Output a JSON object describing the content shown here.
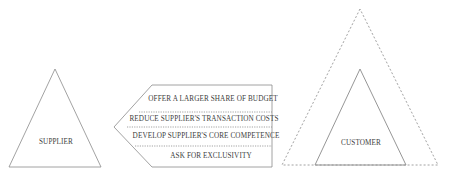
{
  "diagram": {
    "supplier": {
      "label": "SUPPLIER"
    },
    "customer": {
      "label": "CUSTOMER"
    },
    "arrow": {
      "direction": "left",
      "items": [
        {
          "label": "OFFER A LARGER SHARE OF BUDGET"
        },
        {
          "label": "REDUCE SUPPLIER'S TRANSACTION COSTS"
        },
        {
          "label": "DEVELOP SUPPLIER'S CORE COMPETENCE"
        },
        {
          "label": "ASK FOR EXCLUSIVITY"
        }
      ]
    },
    "colors": {
      "line": "#8a8a8a",
      "text": "#3c3c3c",
      "background": "#ffffff"
    }
  }
}
